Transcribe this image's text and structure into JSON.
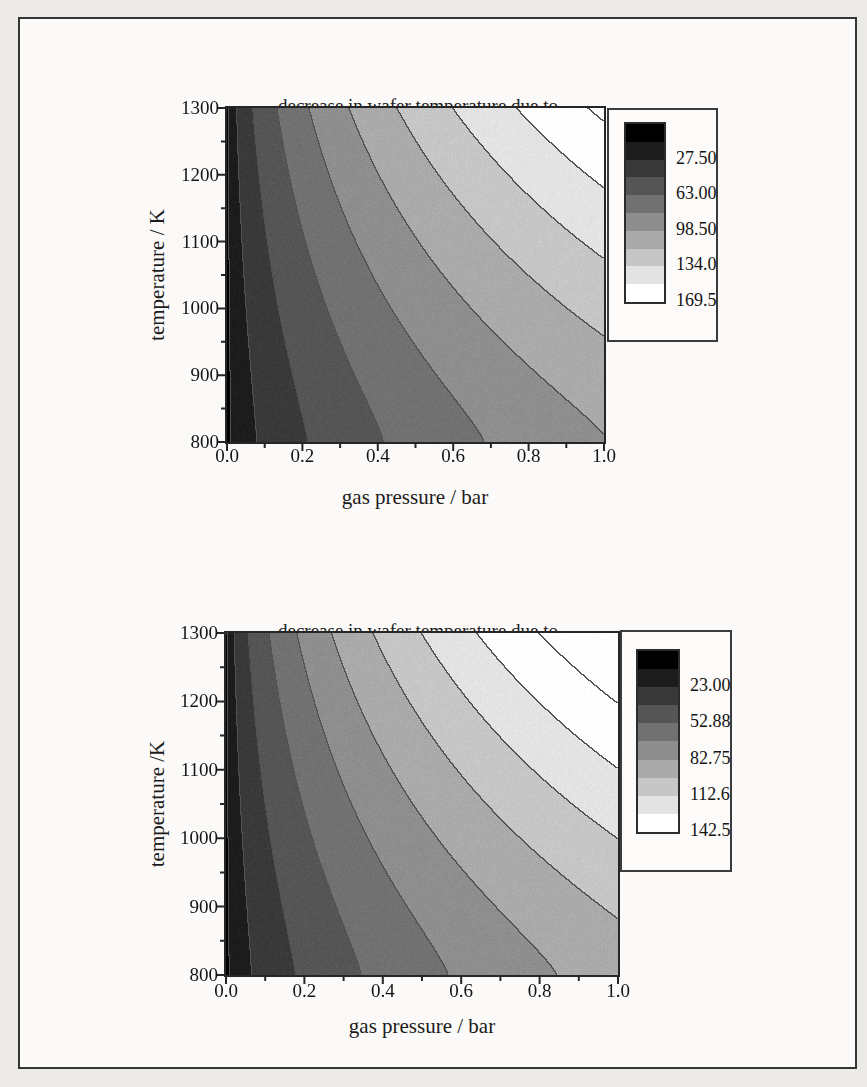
{
  "page": {
    "background": "#eceae7",
    "paper_color": "#fbfaf8",
    "frame_border_color": "#353535",
    "text_color": "#171717"
  },
  "figures": [
    {
      "id": "nitrogen",
      "title_line1": "decrease in wafer temperature due to",
      "title_line2": {
        "pre": "steady gas flow of ",
        "gas": "nitrogen",
        "open": "( ",
        "rho": "ρ",
        "post": " = 1.25 kg m",
        "sup": "-3",
        "close": ")"
      },
      "xlabel": "gas pressure / bar",
      "ylabel": "temperature / K",
      "legend_labels": [
        "27.50",
        "63.00",
        "98.50",
        "134.0",
        "169.5"
      ]
    },
    {
      "id": "argon",
      "title_line1": "decrease in wafer temperature due to",
      "title_line2": {
        "pre": "steady gas flow of ",
        "gas": "argon",
        "open": " ( ",
        "rho": "ρ",
        "post": " = 1.78 kg m",
        "sup": "-3",
        "close": " )"
      },
      "xlabel": "gas pressure / bar",
      "ylabel": "temperature /K",
      "legend_labels": [
        "23.00",
        "52.88",
        "82.75",
        "112.6",
        "142.5"
      ]
    }
  ],
  "chart_data": [
    {
      "type": "heatmap",
      "subtype": "filled-contour",
      "title": "decrease in wafer temperature due to steady gas flow of nitrogen (rho = 1.25 kg m-3)",
      "xlabel": "gas pressure / bar",
      "ylabel": "temperature / K",
      "x_range": [
        0.0,
        1.0
      ],
      "y_range": [
        800,
        1300
      ],
      "x_tick_labels": [
        "0.0",
        "0.2",
        "0.4",
        "0.6",
        "0.8",
        "1.0"
      ],
      "x_tick_values": [
        0.0,
        0.2,
        0.4,
        0.6,
        0.8,
        1.0
      ],
      "x_minor_ticks": [
        0.1,
        0.3,
        0.5,
        0.7,
        0.9
      ],
      "y_tick_labels": [
        "1300",
        "1200",
        "1100",
        "1000",
        "900",
        "800"
      ],
      "y_tick_values": [
        1300,
        1200,
        1100,
        1000,
        900,
        800
      ],
      "y_minor_ticks": [
        850,
        950,
        1050,
        1150,
        1250
      ],
      "contour_levels": [
        -8.0,
        9.75,
        27.5,
        45.25,
        63.0,
        80.75,
        98.5,
        116.25,
        134.0,
        151.75,
        169.5
      ],
      "labeled_levels": [
        27.5,
        63.0,
        98.5,
        134.0,
        169.5
      ],
      "legend_labels": [
        "27.50",
        "63.00",
        "98.50",
        "134.0",
        "169.5"
      ],
      "band_grays": [
        "#000000",
        "#1c1c1c",
        "#393939",
        "#555555",
        "#717171",
        "#8e8e8e",
        "#aaaaaa",
        "#c6c6c6",
        "#e3e3e3",
        "#ffffff"
      ],
      "over_color": "#ffffff",
      "legend_position": "right",
      "grid": false,
      "reconstruction_model": {
        "formula": "dT(p,T) = scale * sqrt(p) * (0.565 + 0.435 * ((T-800)/500)^1.22)",
        "scale": 173,
        "base": 0.565,
        "span": 0.435,
        "v_exp": 1.22,
        "p_exp": 0.5
      }
    },
    {
      "type": "heatmap",
      "subtype": "filled-contour",
      "title": "decrease in wafer temperature due to steady gas flow of argon (rho = 1.78 kg m-3)",
      "xlabel": "gas pressure / bar",
      "ylabel": "temperature /K",
      "x_range": [
        0.0,
        1.0
      ],
      "y_range": [
        800,
        1300
      ],
      "x_tick_labels": [
        "0.0",
        "0.2",
        "0.4",
        "0.6",
        "0.8",
        "1.0"
      ],
      "x_tick_values": [
        0.0,
        0.2,
        0.4,
        0.6,
        0.8,
        1.0
      ],
      "x_minor_ticks": [
        0.1,
        0.3,
        0.5,
        0.7,
        0.9
      ],
      "y_tick_labels": [
        "1300",
        "1200",
        "1100",
        "1000",
        "900",
        "800"
      ],
      "y_tick_values": [
        1300,
        1200,
        1100,
        1000,
        900,
        800
      ],
      "y_minor_ticks": [
        850,
        950,
        1050,
        1150,
        1250
      ],
      "contour_levels": [
        -6.88,
        8.06,
        23.0,
        37.94,
        52.88,
        67.81,
        82.75,
        97.69,
        112.63,
        127.56,
        142.5
      ],
      "labeled_levels": [
        23.0,
        52.88,
        82.75,
        112.63,
        142.5
      ],
      "legend_labels": [
        "23.00",
        "52.88",
        "82.75",
        "112.6",
        "142.5"
      ],
      "band_grays": [
        "#000000",
        "#1c1c1c",
        "#393939",
        "#555555",
        "#717171",
        "#8e8e8e",
        "#aaaaaa",
        "#c6c6c6",
        "#e3e3e3",
        "#ffffff"
      ],
      "over_color": "#ffffff",
      "legend_position": "right",
      "grid": false,
      "reconstruction_model": {
        "formula": "dT(p,T) = scale * sqrt(p) * (0.565 + 0.435 * ((T-800)/500)^1.22)",
        "scale": 159.4,
        "base": 0.565,
        "span": 0.435,
        "v_exp": 1.22,
        "p_exp": 0.5
      }
    }
  ]
}
